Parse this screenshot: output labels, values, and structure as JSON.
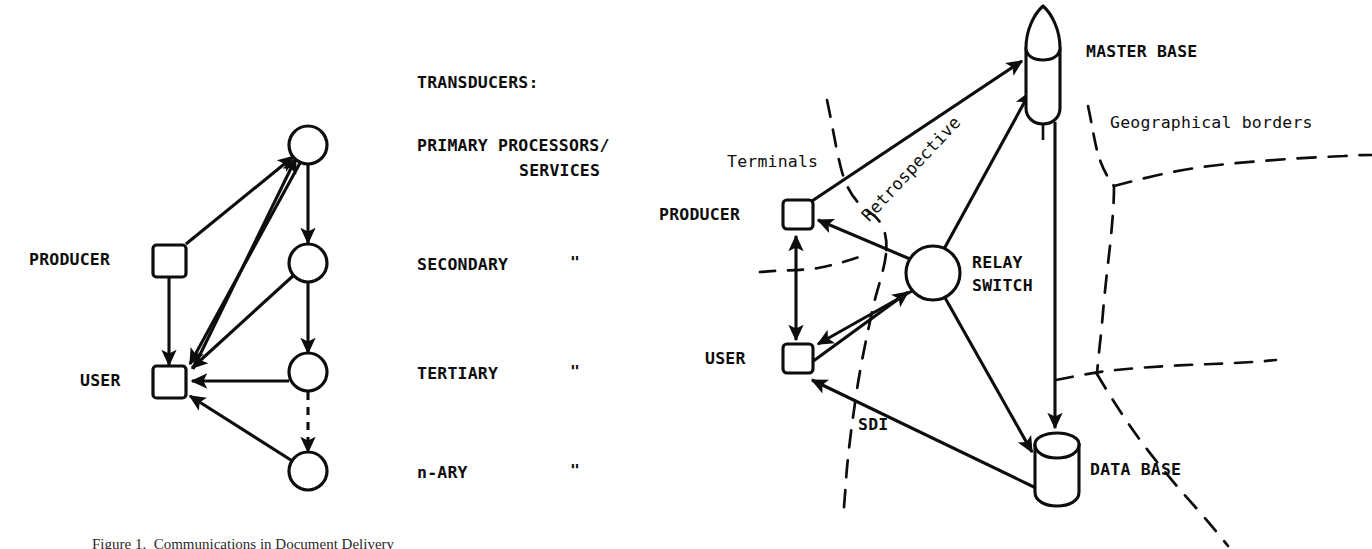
{
  "figure": {
    "caption": "Figure 1.  Communications in Document Delivery",
    "background_color": "#ffffff",
    "ink_color": "#0d0d0d"
  },
  "left_diagram": {
    "name": "hierarchical-transducer-network",
    "nodes": {
      "producer_label": "PRODUCER",
      "user_label": "USER",
      "producer_shape": "square",
      "user_shape": "square",
      "transducer_shape": "circle",
      "transducer_count": 4
    },
    "legend": {
      "heading": "TRANSDUCERS:",
      "items": [
        {
          "label": "PRIMARY PROCESSORS/",
          "label2": "SERVICES",
          "ditto": ""
        },
        {
          "label": "SECONDARY",
          "label2": "",
          "ditto": "\""
        },
        {
          "label": "TERTIARY",
          "label2": "",
          "ditto": "\""
        },
        {
          "label": "n-ARY",
          "label2": "",
          "ditto": "\""
        }
      ]
    },
    "edges": [
      {
        "from": "PRODUCER",
        "to": "PRIMARY",
        "style": "solid",
        "arrow": "single"
      },
      {
        "from": "PRODUCER",
        "to": "USER",
        "style": "solid",
        "arrow": "single"
      },
      {
        "from": "PRIMARY",
        "to": "SECONDARY",
        "style": "solid",
        "arrow": "single"
      },
      {
        "from": "PRIMARY",
        "to": "USER",
        "style": "solid",
        "arrow": "single"
      },
      {
        "from": "SECONDARY",
        "to": "USER",
        "style": "solid",
        "arrow": "single"
      },
      {
        "from": "SECONDARY",
        "to": "TERTIARY",
        "style": "solid",
        "arrow": "single"
      },
      {
        "from": "TERTIARY",
        "to": "USER",
        "style": "solid",
        "arrow": "single"
      },
      {
        "from": "TERTIARY",
        "to": "n-ARY",
        "style": "dashed",
        "arrow": "single"
      },
      {
        "from": "n-ARY",
        "to": "USER",
        "style": "solid",
        "arrow": "single"
      }
    ]
  },
  "right_diagram": {
    "name": "distributed-network",
    "labels": {
      "master_base": "MASTER BASE",
      "data_base": "DATA BASE",
      "relay_switch_line1": "RELAY",
      "relay_switch_line2": "SWITCH",
      "producer": "PRODUCER",
      "user": "USER",
      "terminals": "Terminals",
      "retrospective": "Retrospective",
      "sdi": "SDI",
      "geographical_borders": "Geographical borders"
    },
    "node_shapes": {
      "master_base": "bullet-cylinder",
      "data_base": "cylinder",
      "relay_switch": "circle",
      "producer": "square",
      "user": "square"
    },
    "edges": [
      {
        "from": "PRODUCER",
        "to": "MASTER BASE",
        "style": "solid",
        "arrow": "single",
        "label": "Retrospective"
      },
      {
        "from": "RELAY SWITCH",
        "to": "MASTER BASE",
        "style": "solid",
        "arrow": "single"
      },
      {
        "from": "MASTER BASE",
        "to": "DATA BASE",
        "style": "solid",
        "arrow": "single"
      },
      {
        "from": "RELAY SWITCH",
        "to": "PRODUCER",
        "style": "solid",
        "arrow": "single"
      },
      {
        "from": "PRODUCER",
        "to": "USER",
        "style": "solid",
        "arrow": "double"
      },
      {
        "from": "RELAY SWITCH",
        "to": "USER",
        "style": "solid",
        "arrow": "single"
      },
      {
        "from": "USER",
        "to": "RELAY SWITCH",
        "style": "solid",
        "arrow": "single"
      },
      {
        "from": "RELAY SWITCH",
        "to": "DATA BASE",
        "style": "solid",
        "arrow": "single"
      },
      {
        "from": "DATA BASE",
        "to": "USER",
        "style": "solid",
        "arrow": "single",
        "label": "SDI"
      }
    ],
    "borders_style": "dashed"
  }
}
